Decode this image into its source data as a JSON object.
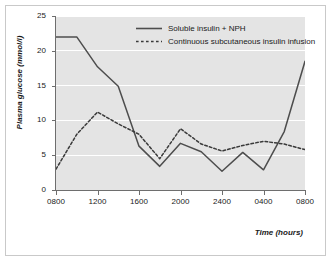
{
  "chart_data": {
    "type": "line",
    "title": "",
    "xlabel": "Time (hours)",
    "ylabel": "Plasma glucose (mmol/l)",
    "xlim": [
      0,
      24
    ],
    "ylim": [
      0,
      25
    ],
    "grid": true,
    "legend_position": "top-right-inside",
    "x_tick_labels": [
      "0800",
      "1200",
      "1600",
      "2000",
      "2400",
      "0400",
      "0800"
    ],
    "x_tick_values": [
      0,
      4,
      8,
      12,
      16,
      20,
      24
    ],
    "y_tick_labels": [
      "0",
      "5",
      "10",
      "15",
      "20",
      "25"
    ],
    "y_tick_values": [
      0,
      5,
      10,
      15,
      20,
      25
    ],
    "x_hours": [
      0,
      2,
      4,
      6,
      8,
      10,
      12,
      14,
      16,
      18,
      20,
      22,
      24
    ],
    "series": [
      {
        "name": "Soluble insulin + NPH",
        "style": "solid",
        "color": "#4d4d4d",
        "values": [
          22.0,
          22.0,
          17.7,
          14.9,
          6.3,
          3.4,
          6.7,
          5.5,
          2.7,
          5.4,
          2.9,
          8.4,
          18.5
        ]
      },
      {
        "name": "Continuous subcutaneous insulin infusion",
        "style": "dashed",
        "color": "#3a3a3a",
        "values": [
          3.0,
          8.0,
          11.2,
          9.5,
          8.0,
          4.5,
          8.8,
          6.6,
          5.6,
          6.4,
          7.0,
          6.6,
          5.8
        ]
      }
    ]
  },
  "legend": {
    "items": [
      {
        "label": "Soluble insulin + NPH",
        "style": "solid"
      },
      {
        "label": "Continuous subcutaneous insulin infusion",
        "style": "dashed"
      }
    ]
  },
  "colors": {
    "plot_background": "#e4e4e4",
    "gridline": "#ffffff",
    "axis": "#6e6e6e",
    "frame_border": "#c9c9c9",
    "page_background": "#ffffff",
    "text": "#1a1a1a"
  }
}
